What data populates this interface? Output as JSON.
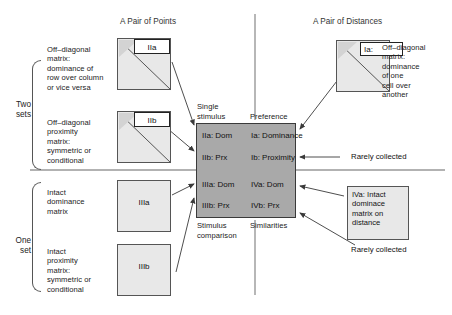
{
  "figure": {
    "column_headers": {
      "left": "A Pair of Points",
      "right": "A Pair of Distances"
    },
    "row_group_labels": {
      "top": "Two\nsets",
      "bottom": "One\nset"
    }
  },
  "left_panel": {
    "items": [
      {
        "description": "Off–diagonal\nmatrix:\ndominance of\nrow over column\nor vice versa",
        "matrix_label": "IIa",
        "matrix_kind": "triangular"
      },
      {
        "description": "Off–diagonal\nproximity\nmatrix:\nsymmetric or\nconditional",
        "matrix_label": "IIb",
        "matrix_kind": "triangular"
      },
      {
        "description": "Intact\ndominance\nmatrix",
        "matrix_label": "IIIa",
        "matrix_kind": "full"
      },
      {
        "description": "Intact\nproximity\nmatrix:\nsymmetric or\nconditional",
        "matrix_label": "IIIb",
        "matrix_kind": "full"
      }
    ]
  },
  "right_panel": {
    "matrix_label": "Ia:",
    "matrix_description": "Off–diagonal\nmatrix:\ndominance\nof one\ncell over\nanother",
    "annotation_box": "IVa:  Intact\ndominace\nmatrix on\ndistance",
    "notes": [
      "Rarely  collected",
      "Rarely collected"
    ]
  },
  "center": {
    "axis_labels": {
      "top_left": "Single\nstimulus",
      "top_right": "Preference",
      "bottom_left": "Stimulus\ncomparison",
      "bottom_right": "Similarities"
    },
    "quadrants": [
      {
        "name": "top-left",
        "lines": [
          "IIa:  Dom",
          "IIb:  Prx"
        ]
      },
      {
        "name": "top-right",
        "lines": [
          "Ia:  Dominance",
          "Ib:  Proximity"
        ]
      },
      {
        "name": "bottom-left",
        "lines": [
          "IIIa:  Dom",
          "IIIb:  Prx"
        ]
      },
      {
        "name": "bottom-right",
        "lines": [
          "IVa:  Dom",
          "IVb:  Prx"
        ]
      }
    ]
  },
  "colors": {
    "center_fill": "#a9a9a9",
    "matrix_fill": "#e8e8e8",
    "line": "#555555",
    "divider": "#888888"
  }
}
